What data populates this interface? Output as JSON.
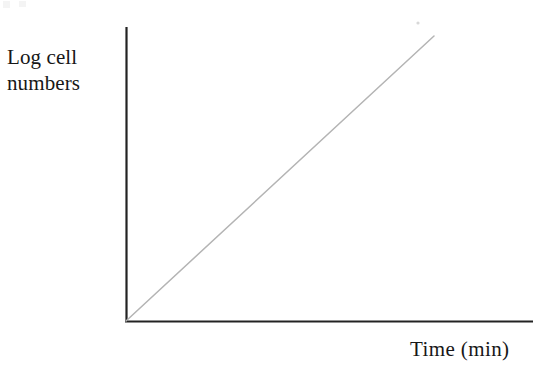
{
  "figure": {
    "background_color": "#ffffff",
    "axis_color": "#232323",
    "line_color": "#b4b4b4",
    "text_color": "#171717",
    "y_axis_label": "Log cell\nnumbers",
    "x_axis_label": "Time (min)"
  },
  "chart_data": {
    "type": "line",
    "title": "",
    "subtitle": "",
    "xlabel": "Time (min)",
    "ylabel": "Log cell numbers",
    "series": [
      {
        "name": "Exponential growth (log cell numbers)",
        "x": [
          0,
          10,
          20,
          30,
          40,
          50,
          60,
          70,
          80,
          90,
          100
        ],
        "values": [
          0,
          10,
          20,
          30,
          40,
          50,
          60,
          70,
          80,
          90,
          100
        ],
        "color": "#b4b4b4",
        "style": "straight-line"
      }
    ],
    "xlim": [
      0,
      100
    ],
    "ylim": [
      0,
      100
    ],
    "x_ticks": [],
    "y_ticks": [],
    "x_tick_labels": [],
    "y_tick_labels": [],
    "grid": false,
    "legend": false,
    "legend_position": "none",
    "annotations": []
  },
  "geometry": {
    "origin": {
      "x": 126,
      "y": 321
    },
    "y_axis_top": {
      "x": 126,
      "y": 27
    },
    "x_axis_right": {
      "x": 533,
      "y": 321
    },
    "data_line_start": {
      "x": 126,
      "y": 321
    },
    "data_line_end": {
      "x": 434,
      "y": 36
    },
    "speck": {
      "x": 418,
      "y": 23,
      "r": 1.6
    }
  }
}
